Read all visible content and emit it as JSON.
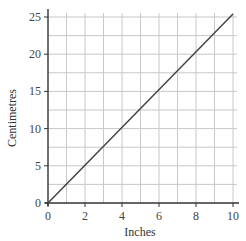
{
  "chart_data": {
    "type": "line",
    "title": "",
    "xlabel": "Inches",
    "ylabel": "Centimetres",
    "xlim": [
      0,
      10
    ],
    "ylim": [
      0,
      25
    ],
    "x_ticks": [
      0,
      2,
      4,
      6,
      8,
      10
    ],
    "y_ticks": [
      0,
      5,
      10,
      15,
      20,
      25
    ],
    "x_minor_grid_step": 1,
    "y_minor_grid_step": 2.5,
    "grid": true,
    "legend": null,
    "series": [
      {
        "name": "Inches to centimetres",
        "x": [
          0,
          10
        ],
        "y": [
          0,
          25.4
        ],
        "color": "#444444"
      }
    ]
  },
  "labels": {
    "xlabel": "Inches",
    "ylabel": "Centimetres",
    "x_ticks": [
      "0",
      "2",
      "4",
      "6",
      "8",
      "10"
    ],
    "y_ticks": [
      "0",
      "5",
      "10",
      "15",
      "20",
      "25"
    ]
  },
  "colors": {
    "grid": "#c8c8c8",
    "axis": "#333333",
    "line": "#444444"
  }
}
